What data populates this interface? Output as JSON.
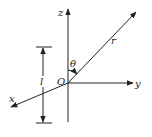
{
  "diagram": {
    "type": "coordinate-system",
    "labels": {
      "z_axis": "z",
      "y_axis": "y",
      "x_axis": "x",
      "origin": "O",
      "vector": "r",
      "angle": "θ",
      "length": "l"
    },
    "colors": {
      "stroke": "#222222",
      "background": "#ffffff"
    }
  }
}
